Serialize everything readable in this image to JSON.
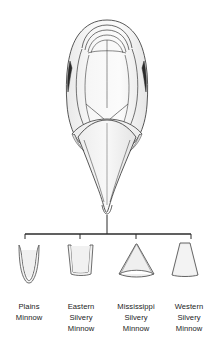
{
  "figure": {
    "illustration_name": "fish-head-ventral-view",
    "illustration_description": "Ventral view of a minnow head showing the throat and basioccipital process region",
    "line_color": "#3a3a3a",
    "fill_color": "#f2f2f2",
    "shadow_color": "#2b2b2b",
    "background_color": "#ffffff",
    "text_color": "#1a1a1a"
  },
  "bracket": {
    "name": "connector-bracket",
    "stem_label": "",
    "tick_count": 4
  },
  "specimens": [
    {
      "id": "plains-minnow",
      "shape_name": "narrow-u-process",
      "label_lines": [
        "Plains",
        "Minnow"
      ],
      "line1": "Plains",
      "line2": "Minnow",
      "line3": ""
    },
    {
      "id": "eastern-silvery-minnow",
      "shape_name": "straight-sided-process",
      "label_lines": [
        "Eastern",
        "Silvery",
        "Minnow"
      ],
      "line1": "Eastern",
      "line2": "Silvery",
      "line3": "Minnow"
    },
    {
      "id": "mississippi-silvery-minnow",
      "shape_name": "broad-concave-process",
      "label_lines": [
        "Mississippi",
        "Silvery",
        "Minnow"
      ],
      "line1": "Mississippi",
      "line2": "Silvery",
      "line3": "Minnow"
    },
    {
      "id": "western-silvery-minnow",
      "shape_name": "tapered-trapezoid-process",
      "label_lines": [
        "Western",
        "Silvery",
        "Minnow"
      ],
      "line1": "Western",
      "line2": "Silvery",
      "line3": "Minnow"
    }
  ]
}
